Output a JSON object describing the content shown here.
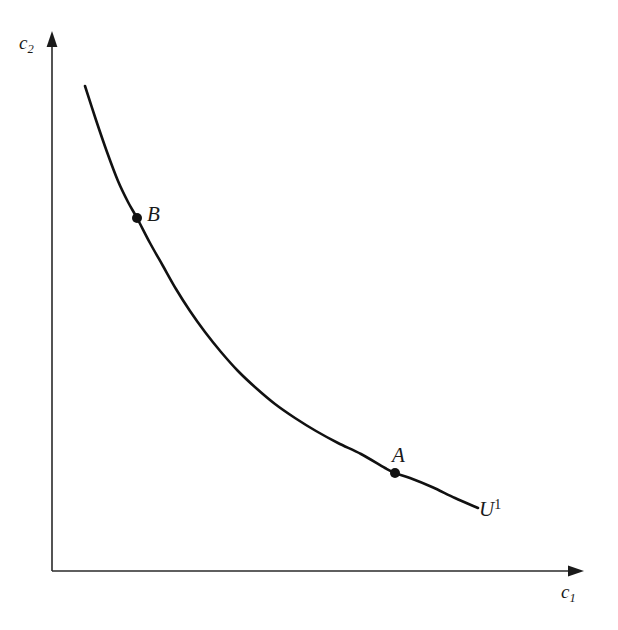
{
  "figure": {
    "background_color": "#ffffff",
    "ink_color": "#1a1a1a",
    "curve_color": "#111111"
  },
  "axes": {
    "y_axis": {
      "label_base": "c",
      "label_sub": "2",
      "icon": "up-arrow-axis",
      "x": 52,
      "y_top": 33,
      "y_bottom": 571
    },
    "x_axis": {
      "label_base": "c",
      "label_sub": "1",
      "icon": "right-arrow-axis",
      "y": 571,
      "x_left": 52,
      "x_right": 583
    }
  },
  "curve": {
    "label_base": "U",
    "label_sup": "1",
    "type": "convex-decreasing",
    "stroke_width": 2.6,
    "start": [
      85,
      86
    ],
    "end": [
      478,
      508
    ]
  },
  "points": [
    {
      "id": "B",
      "label": "B",
      "x": 137,
      "y": 218,
      "radius": 5
    },
    {
      "id": "A",
      "label": "A",
      "x": 395,
      "y": 473,
      "radius": 5
    }
  ],
  "chart_data": {
    "type": "line",
    "title": "",
    "xlabel": "c_1",
    "ylabel": "c_2",
    "grid": false,
    "legend": "none",
    "annotations": [
      {
        "text": "B",
        "x_px": 137,
        "y_px": 218,
        "position": "right-of-point"
      },
      {
        "text": "A",
        "x_px": 395,
        "y_px": 473,
        "position": "above-point"
      },
      {
        "text": "U^1",
        "x_px": 482,
        "y_px": 510,
        "position": "curve-end"
      }
    ],
    "axis_ranges": {
      "x_px": [
        52,
        583
      ],
      "y_px": [
        571,
        33
      ]
    },
    "series": [
      {
        "name": "U^1",
        "description": "Indifference curve: convex to origin, strictly decreasing",
        "points_px": [
          [
            85,
            86
          ],
          [
            96,
            120
          ],
          [
            107,
            152
          ],
          [
            118,
            181
          ],
          [
            128,
            202
          ],
          [
            137,
            218
          ],
          [
            150,
            243
          ],
          [
            163,
            266
          ],
          [
            176,
            289
          ],
          [
            190,
            311
          ],
          [
            205,
            332
          ],
          [
            221,
            352
          ],
          [
            238,
            371
          ],
          [
            256,
            388
          ],
          [
            275,
            404
          ],
          [
            295,
            418
          ],
          [
            316,
            431
          ],
          [
            338,
            443
          ],
          [
            361,
            454
          ],
          [
            385,
            468
          ],
          [
            395,
            473
          ],
          [
            410,
            478
          ],
          [
            432,
            487
          ],
          [
            455,
            498
          ],
          [
            478,
            508
          ]
        ]
      }
    ]
  }
}
